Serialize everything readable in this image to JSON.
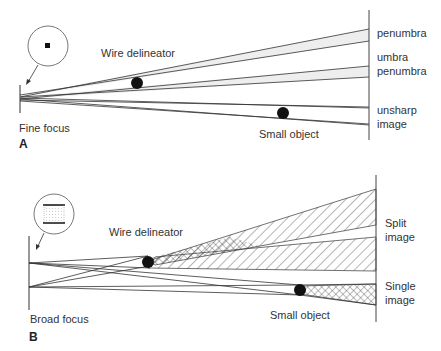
{
  "panel_a": {
    "letter": "A",
    "source_label": "Fine focus",
    "delineator_label": "Wire delineator",
    "object_label": "Small object",
    "right_labels": {
      "penumbra_top": "penumbra",
      "umbra": "umbra",
      "penumbra_bottom": "penumbra",
      "unsharp_1": "unsharp",
      "unsharp_2": "image"
    },
    "inset": "fine focal spot (small dot)"
  },
  "panel_b": {
    "letter": "B",
    "source_label": "Broad focus",
    "delineator_label": "Wire delineator",
    "object_label": "Small object",
    "right_labels": {
      "split_1": "Split",
      "split_2": "image",
      "single_1": "Single",
      "single_2": "image"
    },
    "inset": "broad focal spot (rectangle)"
  },
  "colors": {
    "line": "#333333",
    "hatch": "#444444",
    "background": "#ffffff"
  }
}
